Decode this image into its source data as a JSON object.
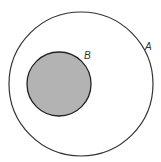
{
  "diagram": {
    "type": "venn-subset",
    "sets": [
      {
        "id": "A",
        "label": "A",
        "cx": 81,
        "cy": 84,
        "r": 72,
        "fill": "#ffffff",
        "stroke": "#333333",
        "label_x": 145,
        "label_y": 50
      },
      {
        "id": "B",
        "label": "B",
        "cx": 59,
        "cy": 84,
        "r": 32,
        "fill": "#b3b3b3",
        "stroke": "#222222",
        "label_x": 84,
        "label_y": 59
      }
    ],
    "relation": "B is a subset of A"
  }
}
